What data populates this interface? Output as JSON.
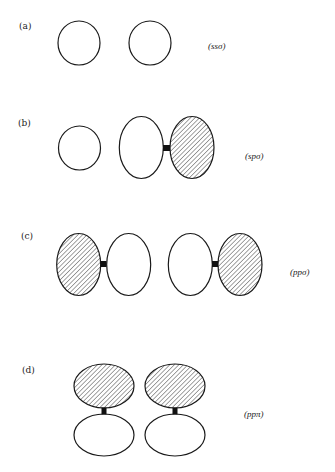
{
  "figure": {
    "colors": {
      "stroke": "#1a1a1a",
      "fill_positive": "#ffffff",
      "hatch": "#1a1a1a",
      "node": "#111111"
    },
    "panels": [
      {
        "id": "a",
        "label": "(a)",
        "bond": "(ssσ)",
        "orbitals": [
          {
            "type": "s",
            "shape": "circle",
            "cx": 79,
            "cy": 43,
            "rx": 21,
            "ry": 22,
            "hatched": false
          },
          {
            "type": "s",
            "shape": "circle",
            "cx": 150,
            "cy": 43,
            "rx": 21,
            "ry": 22,
            "hatched": false
          }
        ],
        "nodes": []
      },
      {
        "id": "b",
        "label": "(b)",
        "bond": "(spσ)",
        "orbitals": [
          {
            "type": "s",
            "shape": "circle",
            "cx": 79.5,
            "cy": 148,
            "rx": 21,
            "ry": 22,
            "hatched": false
          },
          {
            "type": "p-lobe",
            "shape": "ellipse",
            "cx": 141.3,
            "cy": 147.5,
            "rx": 22,
            "ry": 31,
            "hatched": false
          },
          {
            "type": "p-lobe",
            "shape": "ellipse",
            "cx": 192,
            "cy": 147.5,
            "rx": 22,
            "ry": 31,
            "hatched": true
          }
        ],
        "nodes": [
          {
            "x": 163,
            "y": 145,
            "w": 7,
            "h": 6
          }
        ]
      },
      {
        "id": "c",
        "label": "(c)",
        "bond": "(ppσ)",
        "orbitals": [
          {
            "type": "p-lobe",
            "shape": "ellipse",
            "cx": 78.7,
            "cy": 264.5,
            "rx": 22,
            "ry": 31,
            "hatched": true
          },
          {
            "type": "p-lobe",
            "shape": "ellipse",
            "cx": 128.7,
            "cy": 264.5,
            "rx": 22,
            "ry": 31,
            "hatched": false
          },
          {
            "type": "p-lobe",
            "shape": "ellipse",
            "cx": 190.3,
            "cy": 264.5,
            "rx": 22,
            "ry": 31,
            "hatched": false
          },
          {
            "type": "p-lobe",
            "shape": "ellipse",
            "cx": 240,
            "cy": 264.5,
            "rx": 22,
            "ry": 31,
            "hatched": true
          }
        ],
        "nodes": [
          {
            "x": 100.5,
            "y": 261,
            "w": 6,
            "h": 6
          },
          {
            "x": 212,
            "y": 261,
            "w": 6,
            "h": 6
          }
        ]
      },
      {
        "id": "d",
        "label": "(d)",
        "bond": "(ppπ)",
        "orbitals": [
          {
            "type": "p-lobe",
            "shape": "ellipse",
            "cx": 104,
            "cy": 386,
            "rx": 30,
            "ry": 22,
            "hatched": true
          },
          {
            "type": "p-lobe",
            "shape": "ellipse",
            "cx": 104,
            "cy": 435,
            "rx": 30,
            "ry": 21,
            "hatched": false
          },
          {
            "type": "p-lobe",
            "shape": "ellipse",
            "cx": 175,
            "cy": 386,
            "rx": 30,
            "ry": 22,
            "hatched": true
          },
          {
            "type": "p-lobe",
            "shape": "ellipse",
            "cx": 175,
            "cy": 435,
            "rx": 30,
            "ry": 21,
            "hatched": false
          }
        ],
        "nodes": [
          {
            "x": 101.5,
            "y": 407.5,
            "w": 5,
            "h": 7
          },
          {
            "x": 172.5,
            "y": 407.5,
            "w": 5,
            "h": 7
          }
        ]
      }
    ]
  },
  "layout": {
    "panel_label_pos": [
      {
        "x": 19,
        "y": 29
      },
      {
        "x": 18,
        "y": 126
      },
      {
        "x": 21,
        "y": 239
      },
      {
        "x": 22,
        "y": 373
      }
    ],
    "bond_label_pos": [
      {
        "x": 208,
        "y": 49
      },
      {
        "x": 245,
        "y": 159
      },
      {
        "x": 290,
        "y": 275
      },
      {
        "x": 244,
        "y": 417
      }
    ]
  }
}
